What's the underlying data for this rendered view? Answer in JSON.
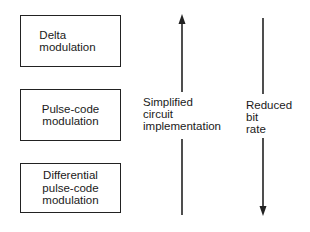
{
  "diagram": {
    "type": "comparison-ordering",
    "boxes": [
      {
        "id": "delta",
        "label_lines": [
          "Delta",
          "modulation"
        ],
        "label": "Delta modulation"
      },
      {
        "id": "pcm",
        "label_lines": [
          "Pulse-code",
          "modulation"
        ],
        "label": "Pulse-code modulation"
      },
      {
        "id": "dpcm",
        "label_lines": [
          "Differential",
          "pulse-code",
          "modulation"
        ],
        "label": "Differential pulse-code modulation"
      }
    ],
    "arrows": [
      {
        "id": "up-arrow",
        "direction": "up",
        "label_lines": [
          "Simplified",
          "circuit",
          "implementation"
        ],
        "label": "Simplified circuit implementation"
      },
      {
        "id": "down-arrow",
        "direction": "down",
        "label_lines": [
          "Reduced",
          "bit",
          "rate"
        ],
        "label": "Reduced bit rate"
      }
    ],
    "colors": {
      "line": "#222222",
      "background": "#ffffff",
      "text": "#1a1a1a"
    }
  }
}
